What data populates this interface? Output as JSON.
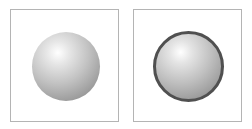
{
  "panels": [
    {
      "id": "left",
      "sphere": {
        "style": "plain",
        "border": "none"
      }
    },
    {
      "id": "right",
      "sphere": {
        "style": "ringed",
        "border": "dark-gray"
      }
    }
  ],
  "colors": {
    "background": "#ffffff",
    "panel_border": "#b4b4b4",
    "ring": "#505050",
    "sphere_highlight": "#ffffff",
    "sphere_shadow": "#8a8a8a"
  }
}
